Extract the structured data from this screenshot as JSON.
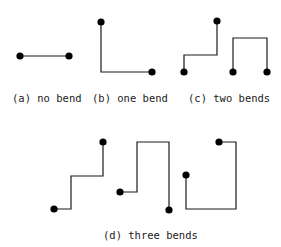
{
  "figure": {
    "line_color": "#1a1a1a",
    "dot_color": "#000000",
    "panels": [
      {
        "id": "a",
        "caption": "(a) no bend",
        "caption_pos": [
          12,
          92
        ],
        "paths": [
          {
            "points": [
              [
                20,
                56
              ],
              [
                69,
                56
              ]
            ]
          }
        ]
      },
      {
        "id": "b",
        "caption": "(b) one bend",
        "caption_pos": [
          92,
          92
        ],
        "paths": [
          {
            "points": [
              [
                101,
                22
              ],
              [
                101,
                72
              ],
              [
                152,
                72
              ]
            ]
          }
        ]
      },
      {
        "id": "c",
        "caption": "(c) two bends",
        "caption_pos": [
          188,
          92
        ],
        "paths": [
          {
            "points": [
              [
                184,
                72
              ],
              [
                184,
                55
              ],
              [
                217,
                55
              ],
              [
                217,
                21
              ]
            ]
          },
          {
            "points": [
              [
                233,
                72
              ],
              [
                233,
                38
              ],
              [
                267,
                38
              ],
              [
                267,
                72
              ]
            ]
          }
        ]
      },
      {
        "id": "d",
        "caption": "(d) three bends",
        "caption_pos": [
          103,
          229
        ],
        "paths": [
          {
            "points": [
              [
                54,
                209
              ],
              [
                71,
                209
              ],
              [
                71,
                176
              ],
              [
                103,
                176
              ],
              [
                103,
                142
              ]
            ]
          },
          {
            "points": [
              [
                120,
                192
              ],
              [
                137,
                192
              ],
              [
                137,
                142
              ],
              [
                169,
                142
              ],
              [
                169,
                210
              ]
            ]
          },
          {
            "points": [
              [
                186,
                175
              ],
              [
                186,
                209
              ],
              [
                236,
                209
              ],
              [
                236,
                142
              ],
              [
                219,
                142
              ]
            ]
          }
        ]
      }
    ]
  }
}
